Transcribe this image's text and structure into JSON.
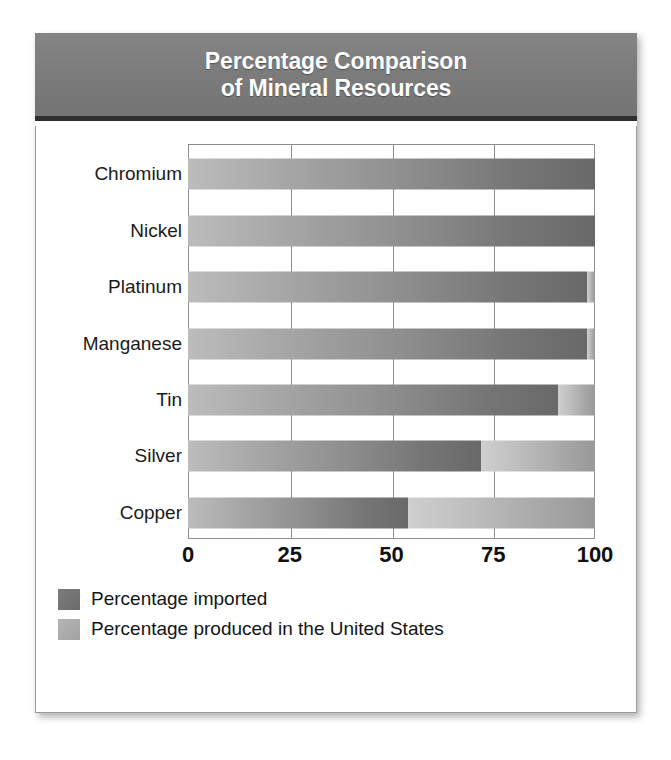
{
  "header": {
    "title_line1": "Percentage Comparison",
    "title_line2": "of Mineral Resources"
  },
  "legend": {
    "items": [
      {
        "label": "Percentage imported",
        "swatch": "dark-gray-swatch",
        "color": "#6e6e6e"
      },
      {
        "label": "Percentage produced in the United States",
        "swatch": "light-gray-swatch",
        "color": "#a8a8a8"
      }
    ]
  },
  "colors": {
    "header_background": "#7a7a7a",
    "header_text": "#ffffff",
    "card_background": "#ffffff",
    "plot_border": "#8e8e8e",
    "imported_bar_start": "#bcbcbc",
    "imported_bar_end": "#696969",
    "produced_bar_start": "#cfcfcf",
    "produced_bar_end": "#999999"
  },
  "chart_data": {
    "type": "bar",
    "orientation": "horizontal",
    "stacked": true,
    "title": "Percentage Comparison of Mineral Resources",
    "xlabel": "",
    "ylabel": "",
    "xlim": [
      0,
      100
    ],
    "xticks": [
      0,
      25,
      50,
      75,
      100
    ],
    "xtick_labels": [
      "0",
      "25",
      "50",
      "75",
      "100"
    ],
    "grid": true,
    "grid_axis": "x",
    "legend_position": "below",
    "categories": [
      "Chromium",
      "Nickel",
      "Platinum",
      "Manganese",
      "Tin",
      "Silver",
      "Copper"
    ],
    "series": [
      {
        "name": "Percentage imported",
        "values": [
          100,
          100,
          98,
          98,
          91,
          72,
          54
        ]
      },
      {
        "name": "Percentage produced in the United States",
        "values": [
          0,
          0,
          2,
          2,
          9,
          28,
          46
        ]
      }
    ]
  }
}
